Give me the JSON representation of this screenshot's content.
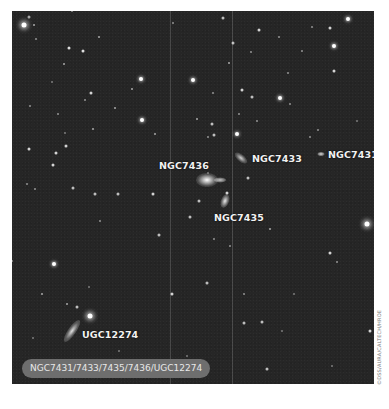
{
  "image": {
    "subject": "Galaxy group field",
    "background_color": "#262626",
    "labels": [
      {
        "id": "ngc7436",
        "text": "NGC7436",
        "x": 147,
        "y": 149
      },
      {
        "id": "ngc7433",
        "text": "NGC7433",
        "x": 240,
        "y": 142
      },
      {
        "id": "ngc7431",
        "text": "NGC7431",
        "x": 316,
        "y": 138
      },
      {
        "id": "ngc7435",
        "text": "NGC7435",
        "x": 202,
        "y": 201
      },
      {
        "id": "ugc12274",
        "text": "UGC12274",
        "x": 70,
        "y": 318
      }
    ],
    "caption": "NGC7431/7433/7435/7436/UGC12274",
    "credit": "©DSS/AURA/CALTECH/HROE"
  }
}
